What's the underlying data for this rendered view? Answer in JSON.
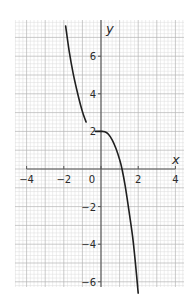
{
  "chart_data": {
    "type": "line",
    "title": "",
    "xlabel": "x",
    "ylabel": "y",
    "xlim": [
      -4,
      4
    ],
    "ylim": [
      -6.5,
      7.8
    ],
    "x_ticks": [
      -4,
      -2,
      0,
      2,
      4
    ],
    "x_tick_labels": [
      "−4",
      "−2",
      "0",
      "2",
      "4"
    ],
    "y_ticks": [
      6,
      4,
      2,
      -2,
      -4,
      -6
    ],
    "y_tick_labels": [
      "6",
      "4",
      "2",
      "−2",
      "−4",
      "−6"
    ],
    "grid": true,
    "grid_minor_step": 0.2,
    "grid_major_step": 1,
    "legend": null,
    "series": [
      {
        "name": "left branch",
        "points": [
          [
            -1.9,
            7.6
          ],
          [
            -1.7,
            6.2
          ],
          [
            -1.5,
            5.1
          ],
          [
            -1.3,
            4.2
          ],
          [
            -1.1,
            3.4
          ],
          [
            -0.95,
            2.9
          ],
          [
            -0.8,
            2.5
          ]
        ]
      },
      {
        "name": "right branch",
        "points": [
          [
            -0.3,
            2.0
          ],
          [
            0.0,
            2.0
          ],
          [
            0.2,
            1.98
          ],
          [
            0.4,
            1.85
          ],
          [
            0.6,
            1.55
          ],
          [
            0.8,
            1.1
          ],
          [
            1.0,
            0.5
          ],
          [
            1.13,
            0.0
          ],
          [
            1.3,
            -0.9
          ],
          [
            1.5,
            -2.2
          ],
          [
            1.7,
            -3.6
          ],
          [
            1.85,
            -5.0
          ],
          [
            2.0,
            -6.6
          ]
        ]
      }
    ]
  },
  "colors": {
    "background": "#ffffff",
    "grid_minor": "#dcdcdc",
    "grid_major": "#b4b4b4",
    "axis": "#555555",
    "curve": "#1f1f1f",
    "text": "#2a2a2a"
  },
  "labels": {
    "x_axis": "x",
    "y_axis": "y"
  }
}
